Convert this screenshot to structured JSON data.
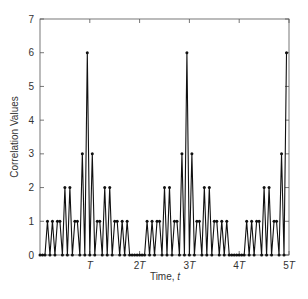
{
  "chart_data": {
    "type": "line",
    "title": "",
    "xlabel": "Time, t",
    "ylabel": "Correlation Values",
    "xlim": [
      0,
      5
    ],
    "ylim": [
      0,
      7
    ],
    "x_ticks": [
      {
        "value": 1,
        "label": "T"
      },
      {
        "value": 2,
        "label": "2T"
      },
      {
        "value": 3,
        "label": "3T"
      },
      {
        "value": 4,
        "label": "4T"
      },
      {
        "value": 5,
        "label": "5T"
      }
    ],
    "y_ticks": [
      0,
      1,
      2,
      3,
      4,
      5,
      6,
      7
    ],
    "grid": false,
    "legend": null,
    "marker": "dot",
    "series": [
      {
        "name": "correlation",
        "x_unit": "T",
        "step": 0.05,
        "values": [
          0,
          0,
          0,
          1,
          0,
          1,
          0,
          1,
          1,
          0,
          2,
          0,
          2,
          0,
          1,
          1,
          0,
          3,
          0,
          6,
          0,
          3,
          0,
          1,
          1,
          0,
          2,
          0,
          2,
          0,
          1,
          1,
          0,
          1,
          0,
          1,
          0,
          0,
          0,
          0,
          0,
          0,
          0,
          1,
          0,
          1,
          0,
          1,
          1,
          0,
          2,
          0,
          2,
          0,
          1,
          1,
          0,
          3,
          0,
          6,
          0,
          3,
          0,
          1,
          1,
          0,
          2,
          0,
          2,
          0,
          1,
          1,
          0,
          1,
          0,
          1,
          0,
          0,
          0,
          0,
          0,
          0,
          0,
          1,
          0,
          1,
          0,
          1,
          1,
          0,
          2,
          0,
          2,
          0,
          1,
          1,
          0,
          3,
          0,
          6
        ]
      }
    ],
    "peaks": [
      {
        "x": "T",
        "value": 6
      },
      {
        "x": "3T",
        "value": 6
      },
      {
        "x": "5T",
        "value": 6
      }
    ]
  },
  "labels": {
    "x_axis_prefix": "Time, ",
    "x_axis_var": "t",
    "y_axis": "Correlation Values",
    "x_tick_T": "T",
    "x_tick_2": "2",
    "x_tick_3": "3",
    "x_tick_4": "4",
    "x_tick_5": "5"
  }
}
